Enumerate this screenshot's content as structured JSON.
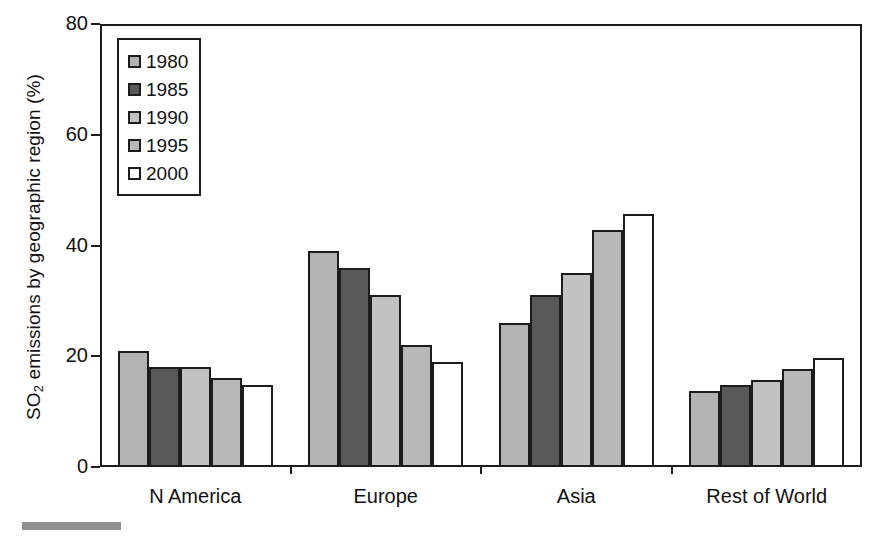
{
  "chart_data": {
    "type": "bar",
    "title": "",
    "xlabel": "",
    "ylabel": "SO2 emissions by geographic region (%)",
    "ylabel_parts": {
      "pre": "SO",
      "sub": "2",
      "post": " emissions by geographic region (%)"
    },
    "categories": [
      "N America",
      "Europe",
      "Asia",
      "Rest of World"
    ],
    "series": [
      {
        "name": "1980",
        "color": "#b3b3b3",
        "values": [
          21.0,
          39.0,
          26.0,
          13.8
        ]
      },
      {
        "name": "1985",
        "color": "#595959",
        "values": [
          18.0,
          36.0,
          31.0,
          14.8
        ]
      },
      {
        "name": "1990",
        "color": "#c2c2c2",
        "values": [
          18.0,
          31.0,
          35.0,
          15.7
        ]
      },
      {
        "name": "1995",
        "color": "#b8b8b8",
        "values": [
          16.0,
          22.0,
          42.8,
          17.7
        ]
      },
      {
        "name": "2000",
        "color": "#ffffff",
        "values": [
          14.9,
          19.0,
          45.7,
          19.6
        ]
      }
    ],
    "ylim": [
      0,
      80
    ],
    "yticks": [
      0,
      20,
      40,
      60,
      80
    ],
    "ytick_labels": [
      "0",
      "20",
      "40",
      "60",
      "80"
    ],
    "grid": false,
    "legend_position": "top-left",
    "legend_entries": [
      "1980",
      "1985",
      "1990",
      "1995",
      "2000"
    ],
    "axis_color": "#1c1c1c",
    "bar_border_color": "#1c1c1c",
    "background_color": "#ffffff"
  }
}
